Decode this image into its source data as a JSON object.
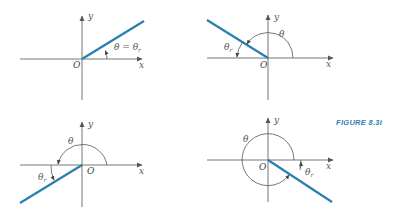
{
  "figure": {
    "caption": "FIGURE 8.3i",
    "colors": {
      "ray": "#2a7fb0",
      "axis": "#666666",
      "caption": "#2a7fb0"
    }
  },
  "panels": [
    {
      "quadrant": "I",
      "origin_label": "O",
      "x_label": "x",
      "y_label": "y",
      "angle_label": "θ = θ",
      "angle_sub": "r"
    },
    {
      "quadrant": "II",
      "origin_label": "O",
      "x_label": "x",
      "y_label": "y",
      "theta_label": "θ",
      "ref_label": "θ",
      "ref_sub": "r"
    },
    {
      "quadrant": "III",
      "origin_label": "O",
      "x_label": "x",
      "y_label": "y",
      "theta_label": "θ",
      "ref_label": "θ",
      "ref_sub": "r"
    },
    {
      "quadrant": "IV",
      "origin_label": "O",
      "x_label": "x",
      "y_label": "y",
      "theta_label": "θ",
      "ref_label": "θ",
      "ref_sub": "r"
    }
  ]
}
